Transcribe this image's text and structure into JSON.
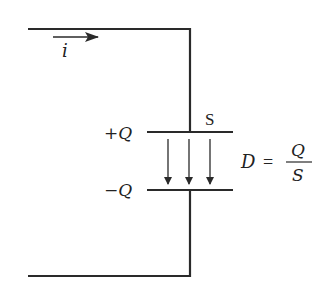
{
  "diagram": {
    "current_label": "i",
    "top_plate_label": "+Q",
    "bottom_plate_label": "−Q",
    "area_label": "S",
    "equation": {
      "lhs": "D",
      "equals": "=",
      "numerator": "Q",
      "denominator": "S"
    },
    "field_arrow_count": 3,
    "colors": {
      "line": "#2a2a2a",
      "background": "#ffffff"
    }
  }
}
